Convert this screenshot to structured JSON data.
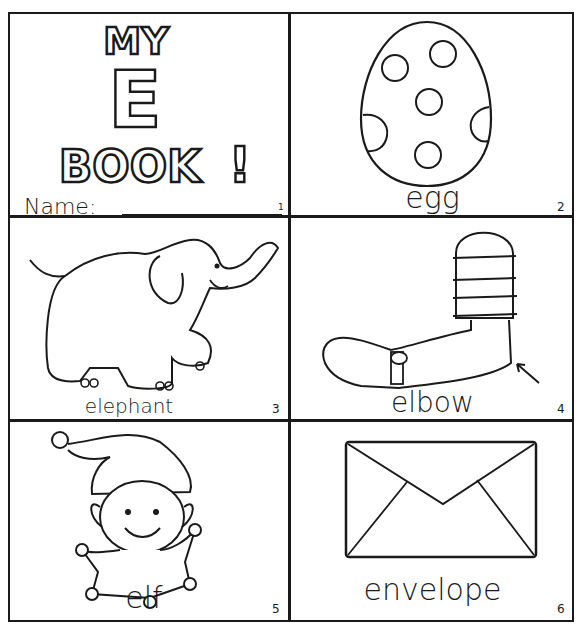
{
  "worksheet": {
    "cover": {
      "title_line1": "MY",
      "title_letter": "E",
      "title_line2": "BOOK",
      "title_exclaim": "!",
      "name_label": "Name:",
      "page_number": "1"
    },
    "pages": [
      {
        "word": "egg",
        "picture": "egg-with-spots",
        "page_number": "2"
      },
      {
        "word": "elephant",
        "picture": "elephant",
        "page_number": "3"
      },
      {
        "word": "elbow",
        "picture": "arm-with-elbow-arrow",
        "page_number": "4"
      },
      {
        "word": "elf",
        "picture": "elf",
        "page_number": "5"
      },
      {
        "word": "envelope",
        "picture": "envelope",
        "page_number": "6"
      }
    ]
  }
}
